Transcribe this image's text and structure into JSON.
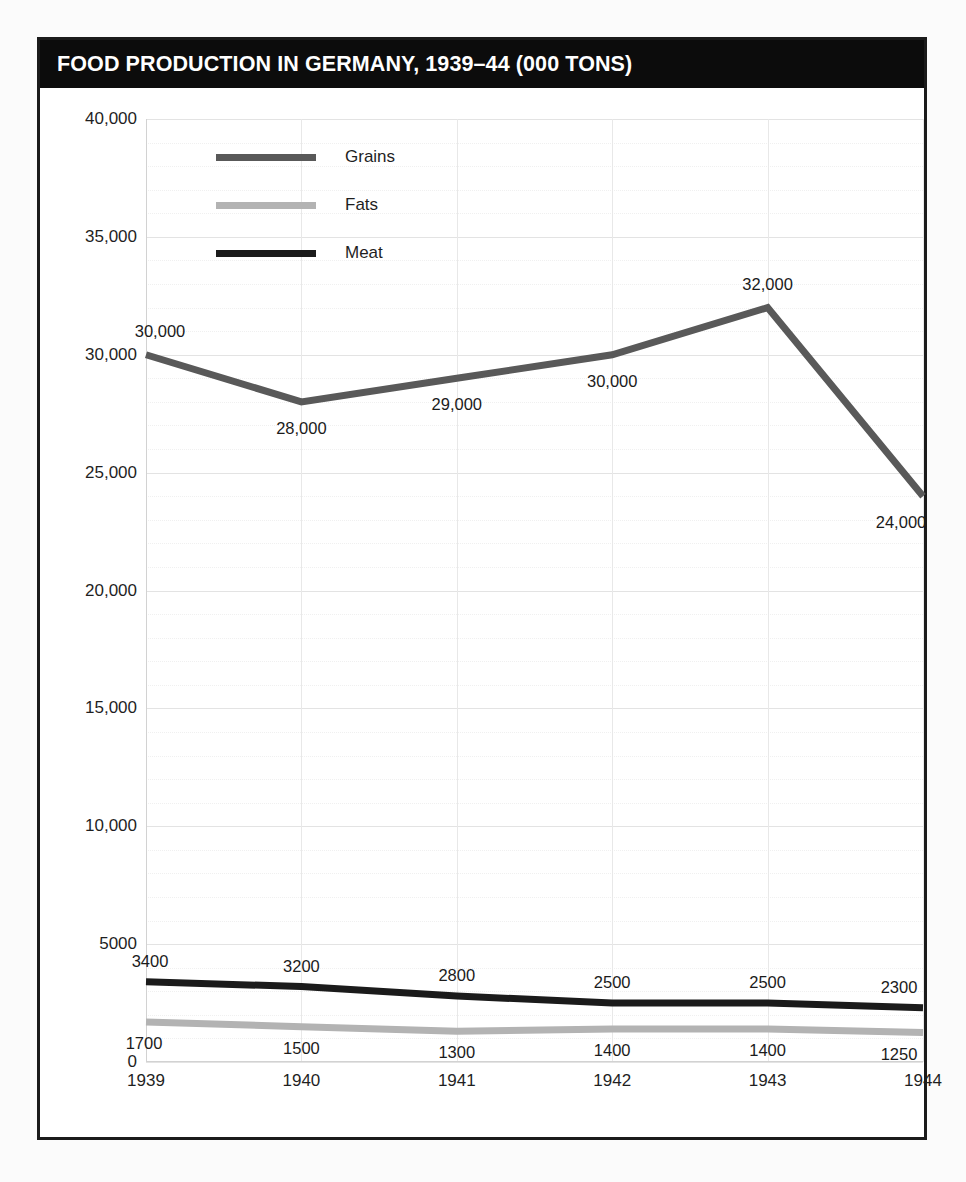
{
  "card": {
    "title": "FOOD PRODUCTION IN GERMANY, 1939–44 (000 TONS)"
  },
  "colors": {
    "grains": "#595959",
    "fats": "#b3b3b3",
    "meat": "#1b1b1b",
    "title_bar_bg": "#0c0c0c",
    "title_text": "#ffffff",
    "frame": "#1b1b1b",
    "grid_major": "#e3e3e3",
    "grid_minor": "#f0f0f0",
    "page_bg": "#fbfbfb"
  },
  "legend": {
    "position": "top-left-inside",
    "items": [
      {
        "label": "Grains",
        "color": "#595959"
      },
      {
        "label": "Fats",
        "color": "#b3b3b3"
      },
      {
        "label": "Meat",
        "color": "#1b1b1b"
      }
    ]
  },
  "axes": {
    "y_ticks": [
      "40,000",
      "35,000",
      "30,000",
      "25,000",
      "20,000",
      "15,000",
      "10,000",
      "5000",
      "0"
    ],
    "y_tick_values": [
      40000,
      35000,
      30000,
      25000,
      20000,
      15000,
      10000,
      5000,
      0
    ],
    "x_ticks": [
      "1939",
      "1940",
      "1941",
      "1942",
      "1943",
      "1944"
    ]
  },
  "chart_data": {
    "type": "line",
    "title": "FOOD PRODUCTION IN GERMANY, 1939–44 (000 TONS)",
    "xlabel": "",
    "ylabel": "",
    "categories": [
      "1939",
      "1940",
      "1941",
      "1942",
      "1943",
      "1944"
    ],
    "x": [
      1939,
      1940,
      1941,
      1942,
      1943,
      1944
    ],
    "ylim": [
      0,
      40000
    ],
    "ytick_step": 5000,
    "yminor_step": 1000,
    "grid": true,
    "legend_position": "upper left",
    "series": [
      {
        "name": "Grains",
        "color": "#595959",
        "values": [
          30000,
          28000,
          29000,
          30000,
          32000,
          24000
        ],
        "labels": [
          "30,000",
          "28,000",
          "29,000",
          "30,000",
          "32,000",
          "24,000"
        ]
      },
      {
        "name": "Fats",
        "color": "#b3b3b3",
        "values": [
          1700,
          1500,
          1300,
          1400,
          1400,
          1250
        ],
        "labels": [
          "1700",
          "1500",
          "1300",
          "1400",
          "1400",
          "1250"
        ]
      },
      {
        "name": "Meat",
        "color": "#1b1b1b",
        "values": [
          3400,
          3200,
          2800,
          2500,
          2500,
          2300
        ],
        "labels": [
          "3400",
          "3200",
          "2800",
          "2500",
          "2500",
          "2300"
        ]
      }
    ]
  },
  "label_offsets": {
    "Grains": [
      {
        "dx": 14,
        "dy": -24
      },
      {
        "dx": 0,
        "dy": 26
      },
      {
        "dx": 0,
        "dy": 26
      },
      {
        "dx": 0,
        "dy": 26
      },
      {
        "dx": 0,
        "dy": -24
      },
      {
        "dx": -22,
        "dy": 26
      }
    ],
    "Meat": [
      {
        "dx": 4,
        "dy": -21
      },
      {
        "dx": 0,
        "dy": -21
      },
      {
        "dx": 0,
        "dy": -21
      },
      {
        "dx": 0,
        "dy": -21
      },
      {
        "dx": 0,
        "dy": -21
      },
      {
        "dx": -24,
        "dy": -21
      }
    ],
    "Fats": [
      {
        "dx": -2,
        "dy": 21
      },
      {
        "dx": 0,
        "dy": 21
      },
      {
        "dx": 0,
        "dy": 21
      },
      {
        "dx": 0,
        "dy": 21
      },
      {
        "dx": 0,
        "dy": 21
      },
      {
        "dx": -24,
        "dy": 21
      }
    ]
  }
}
